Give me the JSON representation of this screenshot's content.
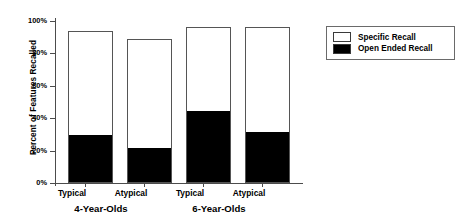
{
  "chart_data": {
    "type": "bar",
    "title": "",
    "xlabel": "",
    "ylabel": "Percent of Features Recalled",
    "ylim": [
      0,
      100
    ],
    "ytick_labels": [
      "0%",
      "20%",
      "40%",
      "60%",
      "80%",
      "100%"
    ],
    "ytick_values": [
      0,
      20,
      40,
      60,
      80,
      100
    ],
    "grid": false,
    "stacked": true,
    "categories": [
      "Typical",
      "Atypical",
      "Typical",
      "Atypical"
    ],
    "groups": [
      {
        "label": "4-Year-Olds",
        "categories": [
          "Typical",
          "Atypical"
        ]
      },
      {
        "label": "6-Year-Olds",
        "categories": [
          "Typical",
          "Atypical"
        ]
      }
    ],
    "series": [
      {
        "name": "Open Ended Recall",
        "color": "#000000",
        "values": [
          29,
          21,
          44,
          31
        ]
      },
      {
        "name": "Specific Recall",
        "color": "#ffffff",
        "values": [
          65,
          68,
          52,
          65
        ]
      }
    ],
    "totals": [
      94,
      89,
      96,
      96
    ],
    "legend_position": "right",
    "legend": [
      {
        "label": "Specific Recall",
        "color": "#ffffff"
      },
      {
        "label": "Open Ended Recall",
        "color": "#000000"
      }
    ]
  }
}
